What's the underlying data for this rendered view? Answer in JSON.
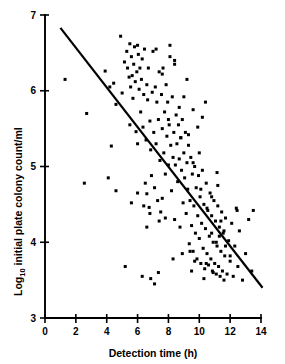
{
  "chart_data": {
    "type": "scatter",
    "title": "",
    "xlabel": "Detection time (h)",
    "ylabel": "Log10 initial plate colony count/ml",
    "ylabel_prefix": "Log",
    "ylabel_subscript": "10",
    "ylabel_suffix": " initial plate colony count/ml",
    "xlim": [
      0,
      14
    ],
    "ylim": [
      3,
      7
    ],
    "xticks": [
      0,
      2,
      4,
      6,
      8,
      10,
      12,
      14
    ],
    "xtick_labels": [
      "0",
      "2",
      "4",
      "6",
      "8",
      "10",
      "12",
      "14"
    ],
    "yticks": [
      3,
      4,
      5,
      6,
      7
    ],
    "ytick_labels": [
      "3",
      "4",
      "5",
      "6",
      "7"
    ],
    "grid": false,
    "legend": "none",
    "marker": "filled-square",
    "marker_size_px": 3,
    "fit_line": {
      "label": "regression line",
      "x": [
        1.0,
        14.1
      ],
      "y": [
        6.83,
        3.4
      ],
      "slope": -0.262,
      "intercept": 7.092
    },
    "x": [
      2.7,
      1.3,
      2.55,
      3.9,
      4.2,
      4.3,
      4.1,
      4.45,
      4.6,
      4.9,
      5.0,
      5.15,
      5.3,
      5.35,
      5.45,
      5.5,
      5.5,
      5.55,
      5.6,
      5.65,
      5.7,
      5.75,
      5.8,
      5.85,
      5.9,
      5.95,
      6.0,
      6.0,
      6.05,
      6.1,
      6.15,
      6.2,
      6.25,
      6.3,
      6.35,
      6.4,
      6.45,
      6.5,
      6.55,
      6.6,
      6.6,
      6.65,
      6.7,
      6.75,
      6.8,
      6.85,
      6.9,
      6.95,
      7.0,
      7.05,
      7.1,
      7.15,
      7.2,
      7.25,
      7.3,
      7.35,
      7.4,
      7.45,
      7.5,
      7.55,
      7.6,
      7.65,
      7.7,
      7.75,
      7.8,
      7.85,
      7.9,
      7.95,
      8.0,
      8.05,
      8.1,
      8.15,
      8.2,
      8.25,
      8.3,
      8.35,
      8.4,
      8.45,
      8.5,
      8.55,
      8.6,
      8.65,
      8.7,
      8.75,
      8.8,
      8.85,
      8.9,
      8.95,
      9.0,
      9.05,
      9.1,
      9.15,
      9.2,
      9.25,
      9.3,
      9.35,
      9.4,
      9.45,
      9.5,
      9.55,
      9.6,
      9.65,
      9.7,
      9.75,
      9.8,
      9.85,
      9.9,
      9.95,
      10.0,
      10.05,
      10.1,
      10.15,
      10.2,
      10.25,
      10.3,
      10.35,
      10.4,
      10.45,
      10.5,
      10.55,
      10.6,
      10.65,
      10.7,
      10.75,
      10.8,
      10.85,
      10.9,
      10.95,
      11.0,
      11.05,
      11.1,
      11.15,
      11.2,
      11.25,
      11.3,
      11.35,
      11.4,
      11.45,
      11.5,
      11.55,
      11.6,
      11.65,
      11.7,
      11.8,
      11.9,
      12.0,
      12.1,
      12.2,
      12.3,
      12.4,
      12.5,
      12.6,
      12.8,
      13.0,
      13.2,
      13.4,
      13.5,
      6.3,
      6.6,
      7.1,
      7.4,
      7.6,
      8.1,
      8.4,
      8.7,
      9.0,
      9.3,
      9.6,
      9.9,
      10.2,
      10.5,
      10.8,
      11.1,
      11.4,
      11.7,
      5.2,
      5.6,
      6.0,
      6.4,
      6.8,
      7.2,
      7.6,
      8.0,
      8.4,
      8.8,
      9.2,
      9.6,
      10.0,
      10.4,
      10.8,
      11.2,
      11.6,
      12.0,
      9.4,
      9.7,
      10.1,
      10.45,
      10.9,
      11.3,
      7.8,
      8.3,
      8.9,
      9.5,
      10.3,
      11.15,
      12.45,
      4.6,
      6.85,
      7.35
    ],
    "y": [
      5.7,
      6.15,
      4.78,
      6.26,
      6.05,
      5.27,
      4.85,
      6.1,
      5.82,
      6.72,
      5.97,
      6.38,
      6.52,
      6.3,
      6.18,
      6.62,
      5.55,
      6.05,
      6.45,
      6.2,
      5.9,
      6.35,
      6.58,
      6.12,
      5.46,
      6.25,
      6.6,
      5.3,
      6.48,
      6.02,
      6.3,
      5.72,
      6.15,
      6.42,
      5.52,
      5.95,
      6.55,
      4.78,
      5.35,
      6.08,
      4.64,
      5.88,
      6.3,
      4.46,
      5.6,
      5.22,
      4.88,
      5.98,
      6.52,
      5.45,
      4.72,
      6.05,
      5.3,
      5.85,
      4.55,
      5.62,
      6.25,
      5.08,
      4.4,
      5.95,
      5.5,
      6.3,
      5.18,
      5.72,
      4.9,
      6.08,
      5.4,
      5.85,
      5.02,
      5.55,
      6.6,
      5.28,
      4.68,
      5.92,
      5.12,
      5.45,
      4.3,
      5.02,
      5.68,
      5.3,
      4.8,
      5.55,
      5.1,
      4.2,
      5.38,
      4.95,
      5.62,
      4.52,
      5.18,
      4.85,
      5.45,
      4.38,
      5.05,
      4.7,
      5.28,
      3.98,
      4.55,
      5.12,
      4.22,
      4.9,
      3.88,
      4.48,
      5.0,
      4.12,
      4.72,
      3.78,
      4.35,
      4.88,
      4.05,
      4.6,
      3.72,
      4.25,
      4.95,
      3.92,
      4.5,
      3.65,
      4.18,
      4.78,
      3.85,
      4.42,
      3.7,
      4.08,
      4.65,
      3.78,
      4.35,
      3.62,
      4.0,
      4.55,
      3.72,
      4.28,
      3.58,
      3.95,
      4.48,
      3.68,
      4.2,
      3.55,
      3.88,
      4.4,
      3.62,
      4.12,
      3.5,
      3.82,
      4.32,
      3.58,
      4.02,
      3.75,
      4.25,
      3.55,
      3.95,
      4.45,
      3.68,
      4.15,
      3.5,
      3.85,
      4.3,
      3.62,
      4.42,
      3.55,
      4.2,
      3.45,
      4.28,
      4.58,
      6.45,
      6.35,
      5.78,
      5.92,
      5.42,
      5.75,
      5.52,
      5.65,
      4.45,
      4.12,
      4.0,
      4.28,
      3.95,
      3.68,
      4.52,
      4.65,
      4.48,
      4.38,
      6.55,
      6.22,
      5.62,
      6.4,
      5.38,
      6.15,
      5.05,
      5.18,
      5.85,
      4.6,
      4.75,
      4.15,
      3.82,
      3.88,
      3.75,
      4.7,
      3.72,
      3.6,
      4.08,
      4.32,
      3.78,
      3.85,
      3.62,
      3.52,
      4.92,
      4.42,
      4.68,
      3.52,
      3.6,
      5.32,
      4.38,
      4.8,
      6.68,
      6.48
    ]
  }
}
